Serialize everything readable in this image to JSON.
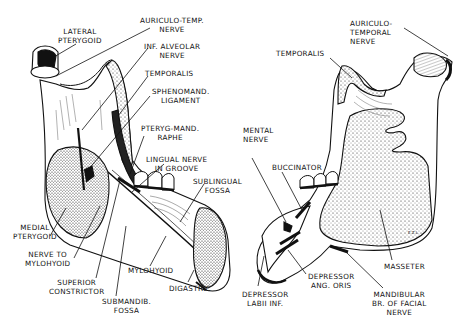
{
  "figure": {
    "left_view": {
      "name": "Medial (lingual) view of mandible",
      "labels": [
        {
          "id": "lateral-pterygoid",
          "lines": [
            "LATERAL",
            "PTERYGOID"
          ]
        },
        {
          "id": "auriculo-temp-nerve",
          "lines": [
            "AURICULO-TEMP.",
            "NERVE"
          ]
        },
        {
          "id": "inf-alveolar-nerve",
          "lines": [
            "INF. ALVEOLAR",
            "NERVE"
          ]
        },
        {
          "id": "temporalis",
          "lines": [
            "TEMPORALIS"
          ]
        },
        {
          "id": "sphenomand-ligament",
          "lines": [
            "SPHENOMAND.",
            "LIGAMENT"
          ]
        },
        {
          "id": "pteryg-mand-raphe",
          "lines": [
            "PTERYG-MAND.",
            "RAPHE"
          ]
        },
        {
          "id": "lingual-nerve",
          "lines": [
            "LINGUAL NERVE",
            "IN GROOVE"
          ]
        },
        {
          "id": "sublingual-fossa",
          "lines": [
            "SUBLINGUAL",
            "FOSSA"
          ]
        },
        {
          "id": "medial-pterygoid",
          "lines": [
            "MEDIAL",
            "PTERYGOID"
          ]
        },
        {
          "id": "nerve-to-mylohyoid",
          "lines": [
            "NERVE TO",
            "MYLOHYOID"
          ]
        },
        {
          "id": "mylohyoid",
          "lines": [
            "MYLOHYOID"
          ]
        },
        {
          "id": "superior-constrictor",
          "lines": [
            "SUPERIOR",
            "CONSTRICTOR"
          ]
        },
        {
          "id": "digastric",
          "lines": [
            "DIGASTRIC"
          ]
        },
        {
          "id": "submandib-fossa",
          "lines": [
            "SUBMANDIB.",
            "FOSSA"
          ]
        }
      ]
    },
    "right_view": {
      "name": "Lateral view of mandible",
      "labels": [
        {
          "id": "auriculo-temporal-nerve",
          "lines": [
            "AURICULO-",
            "TEMPORAL",
            "NERVE"
          ]
        },
        {
          "id": "temporalis",
          "lines": [
            "TEMPORALIS"
          ]
        },
        {
          "id": "mental-nerve",
          "lines": [
            "MENTAL",
            "NERVE"
          ]
        },
        {
          "id": "buccinator",
          "lines": [
            "BUCCINATOR"
          ]
        },
        {
          "id": "masseter",
          "lines": [
            "MASSETER"
          ]
        },
        {
          "id": "depressor-labii-inf",
          "lines": [
            "DEPRESSOR",
            "LABII INF."
          ]
        },
        {
          "id": "depressor-ang-oris",
          "lines": [
            "DEPRESSOR",
            "ANG. ORIS"
          ]
        },
        {
          "id": "mandibular-br-facial-nerve",
          "lines": [
            "MANDIBULAR",
            "BR. OF FACIAL",
            "NERVE"
          ]
        }
      ]
    },
    "signature": "E.Z.L."
  }
}
